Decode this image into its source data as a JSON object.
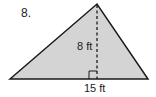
{
  "problem": {
    "number": "8.",
    "shape": "triangle",
    "height_label": "8 ft",
    "base_label": "15 ft",
    "fill_color": "#d4d4d4",
    "stroke_color": "#1a1a1a"
  }
}
